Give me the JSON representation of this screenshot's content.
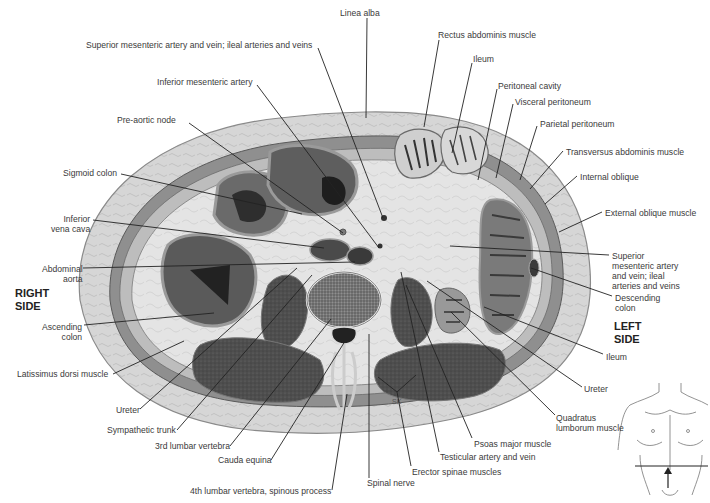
{
  "figure": {
    "type": "anatomical cross-section",
    "colors": {
      "skin_fat": "#d3d3d3",
      "fat_outline": "#8a8a8a",
      "muscle_dark": "#4a4a4a",
      "viscera_light": "#e6e6e6",
      "lumen_dark": "#2e2e2e",
      "leader_line": "#222222",
      "label_text": "#3a3a3a"
    },
    "side_labels": {
      "right": [
        "RIGHT",
        "SIDE"
      ],
      "left": [
        "LEFT",
        "SIDE"
      ]
    },
    "artist_initials": "SK",
    "labels": [
      {
        "id": "linea-alba",
        "text": [
          "Linea alba"
        ],
        "x": 340,
        "y": 8,
        "align": "l",
        "line": [
          [
            367,
            18
          ],
          [
            366,
            118
          ]
        ]
      },
      {
        "id": "sma-smv-ileal-top",
        "text": [
          "Superior mesenteric artery and vein; ileal arteries and veins"
        ],
        "x": 86,
        "y": 40,
        "align": "l",
        "line": [
          [
            318,
            48
          ],
          [
            383,
            218
          ]
        ]
      },
      {
        "id": "inferior-mesenteric-artery",
        "text": [
          "Inferior mesenteric artery"
        ],
        "x": 157,
        "y": 77,
        "align": "l",
        "line": [
          [
            257,
            85
          ],
          [
            379,
            248
          ]
        ]
      },
      {
        "id": "pre-aortic-node",
        "text": [
          "Pre-aortic node"
        ],
        "x": 117,
        "y": 115,
        "align": "l",
        "line": [
          [
            189,
            123
          ],
          [
            343,
            233
          ]
        ]
      },
      {
        "id": "sigmoid-colon",
        "text": [
          "Sigmoid colon"
        ],
        "x": 63,
        "y": 168,
        "align": "l",
        "line": [
          [
            121,
            174
          ],
          [
            302,
            214
          ]
        ]
      },
      {
        "id": "inferior-vena-cava",
        "text": [
          "Inferior",
          "vena cava"
        ],
        "x": 51,
        "y": 214,
        "align": "r",
        "line": [
          [
            93,
            220
          ],
          [
            324,
            248
          ]
        ]
      },
      {
        "id": "abdominal-aorta",
        "text": [
          "Abdominal",
          "aorta"
        ],
        "x": 42,
        "y": 264,
        "align": "r",
        "line": [
          [
            83,
            268
          ],
          [
            355,
            262
          ]
        ]
      },
      {
        "id": "ascending-colon",
        "text": [
          "Ascending",
          "colon"
        ],
        "x": 42,
        "y": 322,
        "align": "r",
        "line": [
          [
            84,
            325
          ],
          [
            214,
            313
          ]
        ]
      },
      {
        "id": "latissimus-dorsi",
        "text": [
          "Latissimus dorsi muscle"
        ],
        "x": 17,
        "y": 369,
        "align": "l",
        "line": [
          [
            113,
            374
          ],
          [
            184,
            341
          ]
        ]
      },
      {
        "id": "ureter-right",
        "text": [
          "Ureter"
        ],
        "x": 116,
        "y": 405,
        "align": "l",
        "line": [
          [
            140,
            409
          ],
          [
            297,
            268
          ]
        ]
      },
      {
        "id": "sympathetic-trunk",
        "text": [
          "Sympathetic trunk"
        ],
        "x": 107,
        "y": 425,
        "align": "l",
        "line": [
          [
            177,
            430
          ],
          [
            312,
            275
          ]
        ]
      },
      {
        "id": "3rd-lumbar-vertebra",
        "text": [
          "3rd lumbar vertebra"
        ],
        "x": 155,
        "y": 441,
        "align": "l",
        "line": [
          [
            230,
            446
          ],
          [
            331,
            319
          ]
        ]
      },
      {
        "id": "cauda-equina",
        "text": [
          "Cauda equina"
        ],
        "x": 218,
        "y": 455,
        "align": "l",
        "line": [
          [
            271,
            460
          ],
          [
            347,
            338
          ]
        ]
      },
      {
        "id": "4th-lumbar-spinous",
        "text": [
          "4th lumbar vertebra, spinous process"
        ],
        "x": 190,
        "y": 486,
        "align": "l",
        "line": [
          [
            332,
            490
          ],
          [
            347,
            394
          ]
        ]
      },
      {
        "id": "spinal-nerve",
        "text": [
          "Spinal nerve"
        ],
        "x": 367,
        "y": 478,
        "align": "l",
        "line": [
          [
            369,
            478
          ],
          [
            369,
            334
          ]
        ]
      },
      {
        "id": "erector-spinae",
        "text": [
          "Erector spinae muscles"
        ],
        "x": 412,
        "y": 467,
        "align": "l",
        "line": [
          [
            411,
            466
          ],
          [
            397,
            392
          ]
        ],
        "branches": [
          [
            [
              397,
              392
            ],
            [
              378,
              377
            ]
          ],
          [
            [
              397,
              392
            ],
            [
              416,
              375
            ]
          ]
        ]
      },
      {
        "id": "testicular-artery-vein",
        "text": [
          "Testicular artery and vein"
        ],
        "x": 440,
        "y": 452,
        "align": "l",
        "line": [
          [
            439,
            452
          ],
          [
            401,
            272
          ]
        ]
      },
      {
        "id": "psoas-major",
        "text": [
          "Psoas major muscle"
        ],
        "x": 474,
        "y": 439,
        "align": "l",
        "line": [
          [
            472,
            438
          ],
          [
            406,
            285
          ]
        ]
      },
      {
        "id": "quadratus-lumborum",
        "text": [
          "Quadratus",
          "lumborum muscle"
        ],
        "x": 556,
        "y": 413,
        "align": "l",
        "line": [
          [
            555,
            415
          ],
          [
            451,
            312
          ]
        ]
      },
      {
        "id": "ureter-left",
        "text": [
          "Ureter"
        ],
        "x": 584,
        "y": 384,
        "align": "l",
        "line": [
          [
            582,
            387
          ],
          [
            427,
            281
          ]
        ]
      },
      {
        "id": "ileum-bottom",
        "text": [
          "Ileum"
        ],
        "x": 606,
        "y": 352,
        "align": "l",
        "line": [
          [
            603,
            354
          ],
          [
            484,
            307
          ]
        ]
      },
      {
        "id": "descending-colon",
        "text": [
          "Descending",
          "colon"
        ],
        "x": 615,
        "y": 293,
        "align": "l",
        "line": [
          [
            612,
            296
          ],
          [
            531,
            268
          ]
        ]
      },
      {
        "id": "sma-smv-ileal-right",
        "text": [
          "Superior",
          "mesenteric artery",
          "and vein; ileal",
          "arteries and veins"
        ],
        "x": 612,
        "y": 251,
        "align": "l",
        "line": [
          [
            609,
            255
          ],
          [
            450,
            246
          ]
        ]
      },
      {
        "id": "external-oblique",
        "text": [
          "External oblique muscle"
        ],
        "x": 605,
        "y": 208,
        "align": "l",
        "line": [
          [
            602,
            212
          ],
          [
            559,
            232
          ]
        ]
      },
      {
        "id": "internal-oblique",
        "text": [
          "Internal oblique"
        ],
        "x": 580,
        "y": 172,
        "align": "l",
        "line": [
          [
            577,
            176
          ],
          [
            545,
            204
          ]
        ]
      },
      {
        "id": "transversus-abdominis",
        "text": [
          "Transversus abdominis muscle"
        ],
        "x": 566,
        "y": 147,
        "align": "l",
        "line": [
          [
            563,
            151
          ],
          [
            530,
            189
          ]
        ]
      },
      {
        "id": "parietal-peritoneum",
        "text": [
          "Parietal peritoneum"
        ],
        "x": 540,
        "y": 119,
        "align": "l",
        "line": [
          [
            537,
            126
          ],
          [
            520,
            180
          ]
        ]
      },
      {
        "id": "visceral-peritoneum",
        "text": [
          "Visceral peritoneum"
        ],
        "x": 515,
        "y": 97,
        "align": "l",
        "line": [
          [
            513,
            104
          ],
          [
            496,
            178
          ]
        ]
      },
      {
        "id": "peritoneal-cavity",
        "text": [
          "Peritoneal cavity"
        ],
        "x": 498,
        "y": 81,
        "align": "l",
        "line": [
          [
            497,
            89
          ],
          [
            478,
            180
          ]
        ]
      },
      {
        "id": "ileum-top",
        "text": [
          "Ileum"
        ],
        "x": 473,
        "y": 54,
        "align": "l",
        "line": [
          [
            472,
            63
          ],
          [
            452,
            153
          ]
        ]
      },
      {
        "id": "rectus-abdominis",
        "text": [
          "Rectus abdominis muscle"
        ],
        "x": 438,
        "y": 30,
        "align": "l",
        "line": [
          [
            439,
            40
          ],
          [
            424,
            127
          ]
        ]
      }
    ]
  }
}
